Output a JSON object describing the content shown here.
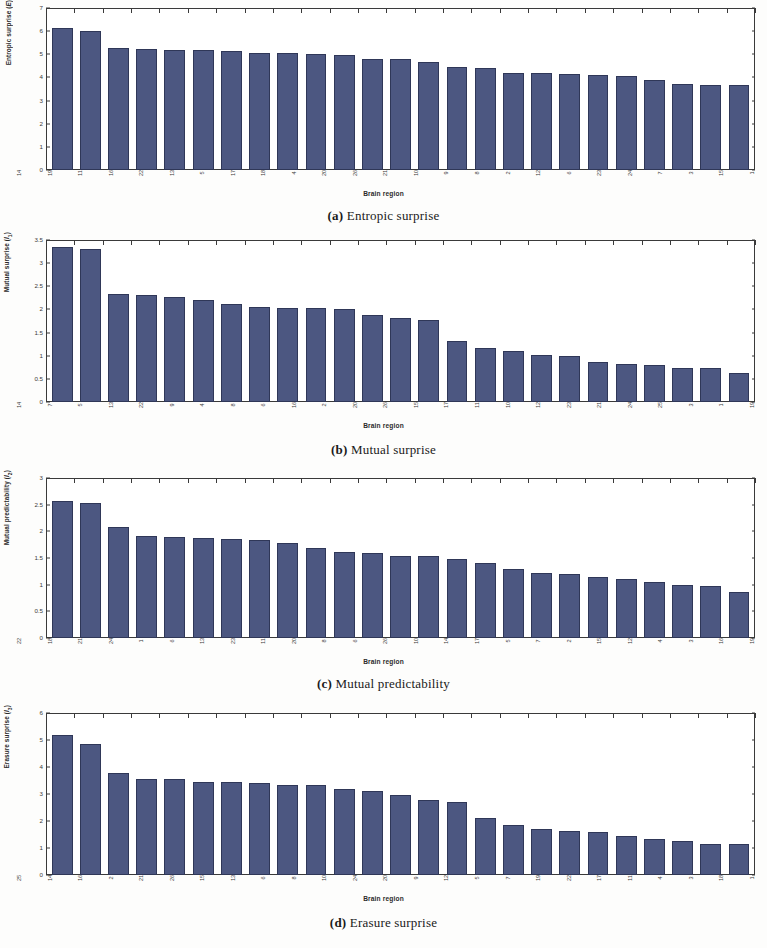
{
  "figure": {
    "xlabel": "Brain region",
    "panels": [
      {
        "key": "a",
        "tag": "(a)",
        "caption": "Entropic surprise",
        "ylabel_text": "Entropic surprise (E)",
        "ylabel_main": "Entropic surprise (",
        "ylabel_sym": "E",
        "ylabel_sub": "",
        "ylabel_close": ")"
      },
      {
        "key": "b",
        "tag": "(b)",
        "caption": "Mutual surprise",
        "ylabel_text": "Mutual surprise (I1)",
        "ylabel_main": "Mutual surprise (",
        "ylabel_sym": "I",
        "ylabel_sub": "1",
        "ylabel_close": ")"
      },
      {
        "key": "c",
        "tag": "(c)",
        "caption": "Mutual predictability",
        "ylabel_text": "Mutual predictability (I2)",
        "ylabel_main": "Mutual predictability (",
        "ylabel_sym": "I",
        "ylabel_sub": "2",
        "ylabel_close": ")"
      },
      {
        "key": "d",
        "tag": "(d)",
        "caption": "Erasure surprise",
        "ylabel_text": "Erasure surprise (I3)",
        "ylabel_main": "Erasure surprise (",
        "ylabel_sym": "I",
        "ylabel_sub": "3",
        "ylabel_close": ")"
      }
    ]
  },
  "colors": {
    "bar_fill": "#4c5781",
    "bar_edge": "#2f3758",
    "axis": "#3a3a3a",
    "text": "#1a1a1a",
    "background": "#ffffff"
  },
  "chart_data": [
    {
      "type": "bar",
      "panel": "a",
      "title": "(a) Entropic surprise",
      "xlabel": "Brain region",
      "ylabel": "Entropic surprise (E)",
      "ylim": [
        0,
        7
      ],
      "yticks": [
        0,
        1,
        2,
        3,
        4,
        5,
        6,
        7
      ],
      "grid": false,
      "legend": "none",
      "categories": [
        "14",
        "19",
        "11",
        "16",
        "22",
        "13",
        "5",
        "17",
        "18",
        "4",
        "20",
        "26",
        "21",
        "10",
        "9",
        "8",
        "2",
        "12",
        "6",
        "23",
        "24",
        "7",
        "3",
        "15",
        "1"
      ],
      "values": [
        6.13,
        5.99,
        5.27,
        5.22,
        5.18,
        5.17,
        5.14,
        5.07,
        5.06,
        5.03,
        4.97,
        4.81,
        4.8,
        4.65,
        4.47,
        4.41,
        4.2,
        4.19,
        4.14,
        4.11,
        4.08,
        3.87,
        3.7,
        3.69,
        3.66
      ]
    },
    {
      "type": "bar",
      "panel": "b",
      "title": "(b) Mutual surprise",
      "xlabel": "Brain region",
      "ylabel": "Mutual surprise (I1)",
      "ylim": [
        0,
        3.5
      ],
      "yticks": [
        0,
        0.5,
        1,
        1.5,
        2,
        2.5,
        3,
        3.5
      ],
      "grid": false,
      "legend": "none",
      "categories": [
        "14",
        "7",
        "5",
        "13",
        "22",
        "9",
        "4",
        "8",
        "6",
        "16",
        "2",
        "20",
        "26",
        "15",
        "17",
        "11",
        "10",
        "12",
        "23",
        "21",
        "24",
        "25",
        "3",
        "1",
        "19"
      ],
      "values": [
        3.35,
        3.3,
        2.33,
        2.31,
        2.27,
        2.21,
        2.11,
        2.05,
        2.04,
        2.03,
        2.02,
        1.87,
        1.81,
        1.78,
        1.31,
        1.17,
        1.1,
        1.02,
        0.99,
        0.87,
        0.83,
        0.81,
        0.73,
        0.73,
        0.63
      ]
    },
    {
      "type": "bar",
      "panel": "c",
      "title": "(c) Mutual predictability",
      "xlabel": "Brain region",
      "ylabel": "Mutual predictability (I2)",
      "ylim": [
        0,
        3
      ],
      "yticks": [
        0,
        0.5,
        1,
        1.5,
        2,
        2.5,
        3
      ],
      "grid": false,
      "legend": "none",
      "categories": [
        "22",
        "18",
        "21",
        "24",
        "1",
        "6",
        "13",
        "23",
        "11",
        "20",
        "8",
        "6",
        "26",
        "10",
        "14",
        "17",
        "5",
        "7",
        "2",
        "15",
        "12",
        "4",
        "3",
        "16",
        "19"
      ],
      "values": [
        2.56,
        2.53,
        2.08,
        1.92,
        1.9,
        1.87,
        1.86,
        1.84,
        1.79,
        1.68,
        1.61,
        1.59,
        1.54,
        1.53,
        1.48,
        1.4,
        1.29,
        1.22,
        1.2,
        1.15,
        1.1,
        1.05,
        1.0,
        0.98,
        0.86
      ]
    },
    {
      "type": "bar",
      "panel": "d",
      "title": "(d) Erasure surprise",
      "xlabel": "Brain region",
      "ylabel": "Erasure surprise (I3)",
      "ylim": [
        0,
        6
      ],
      "yticks": [
        0,
        1,
        2,
        3,
        4,
        5,
        6
      ],
      "grid": false,
      "legend": "none",
      "categories": [
        "25",
        "14",
        "16",
        "2",
        "21",
        "26",
        "15",
        "13",
        "6",
        "8",
        "10",
        "24",
        "20",
        "9",
        "12",
        "5",
        "7",
        "19",
        "22",
        "17",
        "11",
        "4",
        "3",
        "18",
        "1"
      ],
      "values": [
        5.2,
        4.85,
        3.79,
        3.55,
        3.55,
        3.46,
        3.46,
        3.4,
        3.35,
        3.32,
        3.19,
        3.12,
        2.95,
        2.78,
        2.71,
        2.11,
        1.84,
        1.71,
        1.63,
        1.58,
        1.44,
        1.34,
        1.26,
        1.16,
        1.15
      ]
    }
  ]
}
